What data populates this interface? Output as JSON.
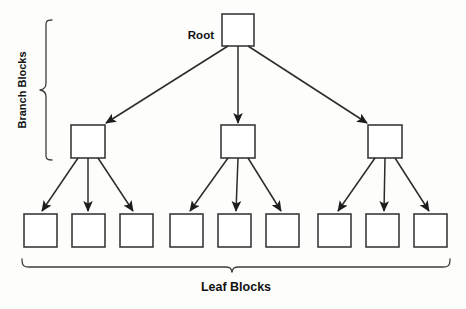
{
  "diagram": {
    "background_color": "#fdfdfc",
    "line_color": "#2b2b2b",
    "box_fill": "#ffffff",
    "box_stroke": "#3a3a3a",
    "labels": {
      "root": "Root",
      "branch_blocks": "Branch Blocks",
      "leaf_blocks": "Leaf Blocks"
    },
    "levels": [
      {
        "name": "root",
        "count": 1,
        "nodes": [
          {
            "id": "root-node",
            "label": "",
            "x": 222,
            "y": 14,
            "w": 32,
            "h": 32
          }
        ]
      },
      {
        "name": "branch",
        "count": 3,
        "nodes": [
          {
            "id": "branch-node-1",
            "label": "",
            "x": 71,
            "y": 125,
            "w": 34,
            "h": 33
          },
          {
            "id": "branch-node-2",
            "label": "",
            "x": 221,
            "y": 125,
            "w": 34,
            "h": 33
          },
          {
            "id": "branch-node-3",
            "label": "",
            "x": 368,
            "y": 125,
            "w": 34,
            "h": 33
          }
        ]
      },
      {
        "name": "leaf",
        "count": 9,
        "nodes": [
          {
            "id": "leaf-node-1",
            "label": "",
            "x": 24,
            "y": 214,
            "w": 33,
            "h": 33
          },
          {
            "id": "leaf-node-2",
            "label": "",
            "x": 72,
            "y": 214,
            "w": 33,
            "h": 33
          },
          {
            "id": "leaf-node-3",
            "label": "",
            "x": 120,
            "y": 214,
            "w": 33,
            "h": 33
          },
          {
            "id": "leaf-node-4",
            "label": "",
            "x": 170,
            "y": 214,
            "w": 33,
            "h": 33
          },
          {
            "id": "leaf-node-5",
            "label": "",
            "x": 218,
            "y": 214,
            "w": 33,
            "h": 33
          },
          {
            "id": "leaf-node-6",
            "label": "",
            "x": 266,
            "y": 214,
            "w": 33,
            "h": 33
          },
          {
            "id": "leaf-node-7",
            "label": "",
            "x": 318,
            "y": 214,
            "w": 33,
            "h": 33
          },
          {
            "id": "leaf-node-8",
            "label": "",
            "x": 366,
            "y": 214,
            "w": 33,
            "h": 33
          },
          {
            "id": "leaf-node-9",
            "label": "",
            "x": 414,
            "y": 214,
            "w": 33,
            "h": 33
          }
        ]
      }
    ],
    "edges": [
      {
        "id": "edge-root-b1",
        "from": "root-node",
        "to": "branch-node-1",
        "x1": 228,
        "y1": 46,
        "x2": 106,
        "y2": 123
      },
      {
        "id": "edge-root-b2",
        "from": "root-node",
        "to": "branch-node-2",
        "x1": 238,
        "y1": 46,
        "x2": 238,
        "y2": 123
      },
      {
        "id": "edge-root-b3",
        "from": "root-node",
        "to": "branch-node-3",
        "x1": 248,
        "y1": 46,
        "x2": 367,
        "y2": 123
      },
      {
        "id": "edge-b1-l1",
        "from": "branch-node-1",
        "to": "leaf-node-1",
        "x1": 78,
        "y1": 158,
        "x2": 42,
        "y2": 211
      },
      {
        "id": "edge-b1-l2",
        "from": "branch-node-1",
        "to": "leaf-node-2",
        "x1": 88,
        "y1": 158,
        "x2": 88,
        "y2": 211
      },
      {
        "id": "edge-b1-l3",
        "from": "branch-node-1",
        "to": "leaf-node-3",
        "x1": 98,
        "y1": 158,
        "x2": 133,
        "y2": 211
      },
      {
        "id": "edge-b2-l4",
        "from": "branch-node-2",
        "to": "leaf-node-4",
        "x1": 228,
        "y1": 158,
        "x2": 190,
        "y2": 211
      },
      {
        "id": "edge-b2-l5",
        "from": "branch-node-2",
        "to": "leaf-node-5",
        "x1": 238,
        "y1": 158,
        "x2": 236,
        "y2": 211
      },
      {
        "id": "edge-b2-l6",
        "from": "branch-node-2",
        "to": "leaf-node-6",
        "x1": 248,
        "y1": 158,
        "x2": 281,
        "y2": 211
      },
      {
        "id": "edge-b3-l7",
        "from": "branch-node-3",
        "to": "leaf-node-7",
        "x1": 375,
        "y1": 158,
        "x2": 338,
        "y2": 211
      },
      {
        "id": "edge-b3-l8",
        "from": "branch-node-3",
        "to": "leaf-node-8",
        "x1": 385,
        "y1": 158,
        "x2": 384,
        "y2": 211
      },
      {
        "id": "edge-b3-l9",
        "from": "branch-node-3",
        "to": "leaf-node-9",
        "x1": 395,
        "y1": 158,
        "x2": 429,
        "y2": 211
      }
    ],
    "braces": [
      {
        "id": "branch-brace",
        "orientation": "vertical-left",
        "covers": "branch",
        "x": 46,
        "y_top": 20,
        "y_bottom": 160
      },
      {
        "id": "leaf-brace",
        "orientation": "horizontal-bottom",
        "covers": "leaf",
        "y": 259,
        "x_left": 22,
        "x_right": 450
      }
    ],
    "label_positions": {
      "root": {
        "x": 214,
        "y": 39,
        "anchor": "end"
      },
      "branch_blocks": {
        "x": 26,
        "y": 92,
        "rotation": -90
      },
      "leaf_blocks": {
        "x": 236,
        "y": 290,
        "anchor": "middle"
      }
    }
  }
}
